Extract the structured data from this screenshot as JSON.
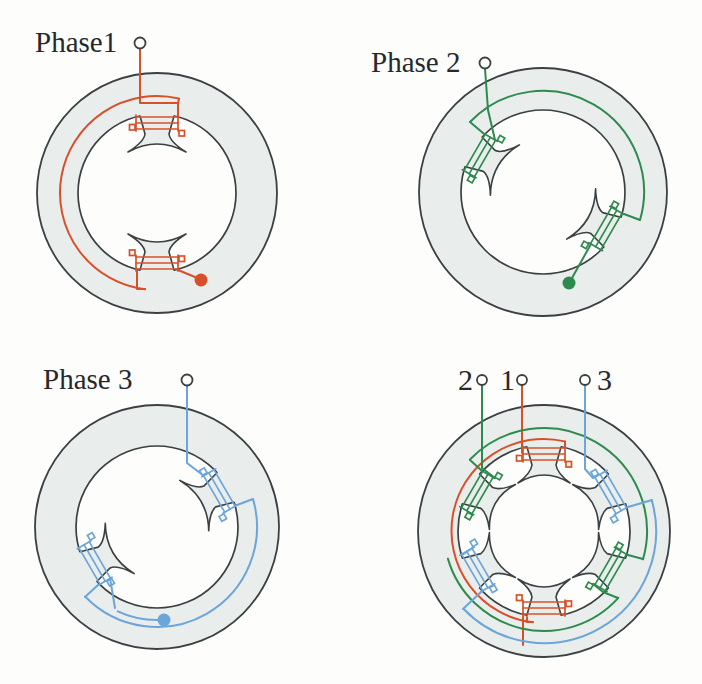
{
  "figure": {
    "panel_labels": [
      "Phase1",
      "Phase 2",
      "Phase 3",
      "2 1 3"
    ]
  },
  "colors": {
    "paper": "#fdfdfb",
    "stator_fill": "#e9edec",
    "outline": "#3b4043",
    "text": "#26292b",
    "red": "#d8502a",
    "green": "#2e8b4d",
    "blue": "#6ba5d9"
  },
  "panels": [
    {
      "key": "phase1",
      "ring": {
        "cx": 157,
        "cy": 193,
        "outerR": 120,
        "innerR": 79
      },
      "hornX": 29,
      "poles": [
        {
          "angle": 0,
          "coil": "red"
        },
        {
          "angle": 180,
          "coil": "red"
        }
      ],
      "terminals": [
        {
          "x": 140,
          "y": 43,
          "r": 5.5
        }
      ],
      "labels": [
        {
          "text": "Phase1",
          "x": 35,
          "y": 52,
          "size": 29,
          "anchor": "start"
        }
      ],
      "wires": [
        {
          "color": "red",
          "type": "poly",
          "pts": [
            [
              140,
              48.5
            ],
            [
              140,
              103
            ],
            [
              178,
              103
            ],
            [
              178,
              116
            ]
          ]
        },
        {
          "color": "red",
          "type": "poly",
          "pts": [
            [
              178,
              103
            ],
            [
              179,
              99
            ]
          ]
        },
        {
          "color": "red",
          "type": "arc",
          "r": 97,
          "from": 13,
          "to": 187,
          "sweep": 0,
          "large": 1
        },
        {
          "color": "red",
          "type": "poly",
          "pts": [
            [
              145,
              289
            ],
            [
              137,
              289
            ],
            [
              137,
              271
            ]
          ]
        },
        {
          "color": "red",
          "type": "poly",
          "pts": [
            [
              178,
              270
            ],
            [
              195,
              277
            ]
          ]
        },
        {
          "color": "red",
          "type": "dot",
          "x": 201,
          "y": 280,
          "r": 6.5
        }
      ]
    },
    {
      "key": "phase2",
      "ring": {
        "cx": 192,
        "cy": 192,
        "outerR": 124,
        "innerR": 82
      },
      "hornX": 29,
      "poles": [
        {
          "angle": -60,
          "coil": "green"
        },
        {
          "angle": 120,
          "coil": "green"
        }
      ],
      "terminals": [
        {
          "x": 134,
          "y": 63,
          "r": 5.5
        }
      ],
      "labels": [
        {
          "text": "Phase 2",
          "x": 20,
          "y": 72,
          "size": 29,
          "anchor": "start"
        }
      ],
      "wires": [
        {
          "color": "green",
          "type": "poly",
          "pts": [
            [
              134,
              68.5
            ],
            [
              137,
              110
            ],
            [
              144,
              140
            ]
          ]
        },
        {
          "color": "green",
          "type": "poly",
          "pts": [
            [
              132,
              133
            ],
            [
              119,
              122
            ]
          ]
        },
        {
          "color": "green",
          "type": "arc",
          "r": 101,
          "from": -46,
          "to": 106,
          "sweep": 1,
          "large": 0
        },
        {
          "color": "green",
          "type": "poly",
          "pts": [
            [
              273,
              214
            ],
            [
              289,
              220
            ]
          ]
        },
        {
          "color": "green",
          "type": "poly",
          "pts": [
            [
              240,
              244
            ],
            [
              221,
              278
            ]
          ]
        },
        {
          "color": "green",
          "type": "dot",
          "x": 218,
          "y": 283,
          "r": 6.5
        }
      ]
    },
    {
      "key": "phase3",
      "ring": {
        "cx": 157,
        "cy": 185,
        "outerR": 122,
        "innerR": 81
      },
      "hornX": 29,
      "poles": [
        {
          "angle": 60,
          "coil": "blue"
        },
        {
          "angle": 240,
          "coil": "blue"
        }
      ],
      "terminals": [
        {
          "x": 187,
          "y": 38,
          "r": 5.5
        }
      ],
      "labels": [
        {
          "text": "Phase 3",
          "x": 43,
          "y": 47,
          "size": 29,
          "anchor": "start"
        }
      ],
      "wires": [
        {
          "color": "blue",
          "type": "poly",
          "pts": [
            [
              187,
              43.5
            ],
            [
              187,
              121
            ],
            [
              204,
              134
            ]
          ]
        },
        {
          "color": "blue",
          "type": "poly",
          "pts": [
            [
              237,
              163
            ],
            [
              253,
              157
            ]
          ]
        },
        {
          "color": "blue",
          "type": "arc",
          "r": 100,
          "from": 74,
          "to": 226,
          "sweep": 1,
          "large": 0
        },
        {
          "color": "blue",
          "type": "poly",
          "pts": [
            [
              98,
              243
            ],
            [
              85,
              255
            ]
          ]
        },
        {
          "color": "blue",
          "type": "poly",
          "pts": [
            [
              110,
              236
            ],
            [
              115,
              266
            ]
          ]
        },
        {
          "color": "blue",
          "type": "arc",
          "r": 93,
          "from": 205,
          "to": 177,
          "sweep": 0,
          "large": 0
        },
        {
          "color": "blue",
          "type": "dot",
          "x": 164,
          "y": 278,
          "r": 6.5
        }
      ]
    },
    {
      "key": "combined",
      "ring": {
        "cx": 193,
        "cy": 189,
        "outerR": 126,
        "innerR": 86
      },
      "hornX": 26,
      "poles": [
        {
          "angle": 0,
          "coil": "red"
        },
        {
          "angle": 60,
          "coil": "blue"
        },
        {
          "angle": 120,
          "coil": "green"
        },
        {
          "angle": 180,
          "coil": "red"
        },
        {
          "angle": 240,
          "coil": "blue"
        },
        {
          "angle": 300,
          "coil": "green"
        }
      ],
      "terminals": [
        {
          "x": 131,
          "y": 38,
          "r": 5
        },
        {
          "x": 171,
          "y": 38,
          "r": 5
        },
        {
          "x": 234,
          "y": 38,
          "r": 5
        }
      ],
      "labels": [
        {
          "text": "2",
          "x": 122,
          "y": 48,
          "size": 30,
          "anchor": "end"
        },
        {
          "text": "1",
          "x": 164,
          "y": 48,
          "size": 30,
          "anchor": "end"
        },
        {
          "text": "3",
          "x": 246,
          "y": 48,
          "size": 30,
          "anchor": "start"
        }
      ],
      "wires": [
        {
          "color": "red",
          "type": "poly",
          "pts": [
            [
              171,
              43
            ],
            [
              171,
              111
            ]
          ]
        },
        {
          "color": "red",
          "type": "poly",
          "pts": [
            [
              214,
              104
            ],
            [
              214,
              99.5
            ]
          ]
        },
        {
          "color": "red",
          "type": "arc",
          "r": 92,
          "from": 13,
          "to": 187,
          "sweep": 0,
          "large": 1
        },
        {
          "color": "red",
          "type": "poly",
          "pts": [
            [
              182,
              280
            ],
            [
              176,
              280
            ],
            [
              176,
              275
            ]
          ]
        },
        {
          "color": "red",
          "type": "poly",
          "pts": [
            [
              172,
              275
            ],
            [
              172,
              303
            ]
          ]
        },
        {
          "color": "green",
          "type": "poly",
          "pts": [
            [
              131,
              43
            ],
            [
              131,
              126
            ],
            [
              144,
              136
            ]
          ]
        },
        {
          "color": "green",
          "type": "poly",
          "pts": [
            [
              130,
              128
            ],
            [
              119,
              118
            ]
          ]
        },
        {
          "color": "green",
          "type": "arc",
          "r": 103,
          "from": -46,
          "to": 106,
          "sweep": 1,
          "large": 0
        },
        {
          "color": "green",
          "type": "poly",
          "pts": [
            [
              277,
              213
            ],
            [
              292,
              217
            ]
          ]
        },
        {
          "color": "green",
          "type": "poly",
          "pts": [
            [
              242,
              242
            ],
            [
              252,
              250
            ],
            [
              267,
              256
            ]
          ]
        },
        {
          "color": "green",
          "type": "arc",
          "r": 100,
          "from": 132,
          "to": 254,
          "sweep": 1,
          "large": 0
        },
        {
          "color": "blue",
          "type": "poly",
          "pts": [
            [
              234,
              43
            ],
            [
              234,
              127
            ],
            [
              242,
              136
            ]
          ]
        },
        {
          "color": "blue",
          "type": "poly",
          "pts": [
            [
              277,
              165
            ],
            [
              301,
              158
            ]
          ]
        },
        {
          "color": "blue",
          "type": "arc",
          "r": 112,
          "from": 74,
          "to": 226,
          "sweep": 1,
          "large": 0
        },
        {
          "color": "blue",
          "type": "poly",
          "pts": [
            [
              130,
              250
            ],
            [
              112,
              267
            ]
          ]
        },
        {
          "color": "blue",
          "type": "poly",
          "pts": [
            [
              123,
              205
            ],
            [
              111,
              213
            ]
          ]
        }
      ]
    }
  ]
}
